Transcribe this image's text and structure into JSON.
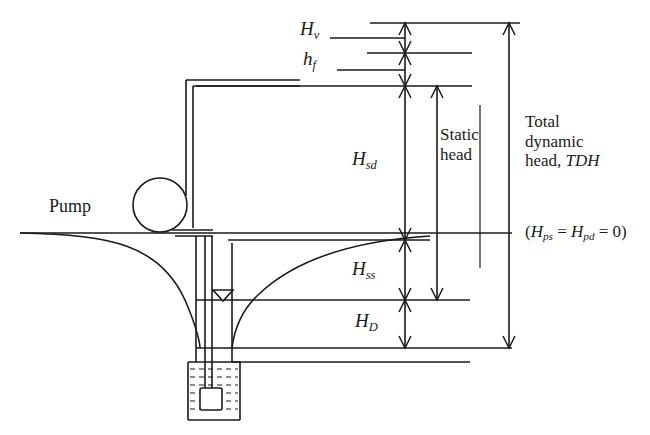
{
  "diagram": {
    "stroke_color": "#1a1a1a",
    "background": "#ffffff"
  },
  "labels": {
    "velocity_head": {
      "symbol": "H",
      "subscript": "v"
    },
    "friction_head": {
      "symbol": "h",
      "subscript": "f"
    },
    "static_discharge_head": {
      "symbol": "H",
      "subscript": "sd"
    },
    "static_suction_head": {
      "symbol": "H",
      "subscript": "ss"
    },
    "drawdown_head": {
      "symbol": "H",
      "subscript": "D"
    },
    "pump": "Pump"
  },
  "brackets": {
    "static_head": {
      "line1": "Static",
      "line2": "head"
    },
    "total_dynamic_head": {
      "line1": "Total",
      "line2": "dynamic",
      "line3_prefix": "head, ",
      "line3_italic": "TDH"
    },
    "pressure_note": {
      "open": "(",
      "sym1": "H",
      "sub1": "ps",
      "eq1": " = ",
      "sym2": "H",
      "sub2": "pd",
      "eq2": " = 0)"
    }
  },
  "geometry": {
    "levels": {
      "discharge_top_y": 23,
      "velocity_head_y": 53,
      "friction_head_y": 85,
      "ground_y": 233,
      "static_water_y": 300,
      "pumping_water_y": 348
    },
    "dimension_lines": {
      "main_x": 405,
      "static_head_x": 437,
      "tdh_x": 509
    }
  }
}
